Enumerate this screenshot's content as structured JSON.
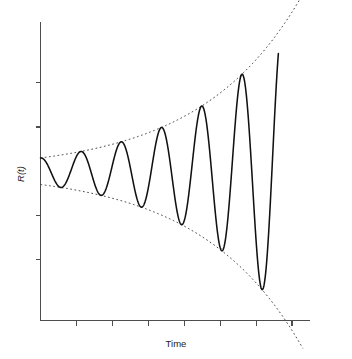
{
  "chart_data": {
    "type": "line",
    "title": "",
    "subtitle": "",
    "xlabel": "Time",
    "ylabel": "R(t)",
    "grid": false,
    "legend": null,
    "legend_position": "none",
    "axis_ticks_labeled": false,
    "xlim": [
      0,
      7.5
    ],
    "ylim": [
      -1.35,
      1.35
    ],
    "x_tick_count": 7,
    "x_ticks": [
      1,
      2,
      3,
      4,
      5,
      6,
      7
    ],
    "y_tick_count": 4,
    "y_ticks": [
      -0.8,
      -0.4,
      0.4,
      0.8
    ],
    "series": [
      {
        "name": "R(t)",
        "style": "solid",
        "color": "#111111",
        "model": "growing-cosine",
        "formula": "R(t) = A0 * exp(g*t) * cos(2*pi*t/T)",
        "A0": 0.12,
        "growth_rate": 0.355,
        "period": 1.12,
        "phase": 0.0,
        "t_start": 0.0,
        "t_end": 6.62,
        "samples": 900,
        "peaks": [
          {
            "t": 0.0,
            "value": 0.12
          },
          {
            "t": 1.12,
            "value": 0.179
          },
          {
            "t": 2.24,
            "value": 0.266
          },
          {
            "t": 3.36,
            "value": 0.396
          },
          {
            "t": 4.48,
            "value": 0.59
          },
          {
            "t": 5.6,
            "value": 0.879
          }
        ],
        "troughs": [
          {
            "t": 0.56,
            "value": -0.146
          },
          {
            "t": 1.68,
            "value": -0.218
          },
          {
            "t": 2.8,
            "value": -0.325
          },
          {
            "t": 3.92,
            "value": -0.484
          },
          {
            "t": 5.04,
            "value": -0.72
          },
          {
            "t": 6.16,
            "value": -1.072
          }
        ]
      },
      {
        "name": "upper envelope",
        "style": "dashed",
        "color": "#3a3a3a",
        "model": "exponential-envelope-upper",
        "formula": "+A0 * exp(g*t)",
        "endpoints": [
          {
            "t": 0.0,
            "value": 0.12
          },
          {
            "t": 7.3,
            "value": 1.28
          }
        ]
      },
      {
        "name": "lower envelope",
        "style": "dashed",
        "color": "#3a3a3a",
        "model": "exponential-envelope-lower",
        "formula": "-A0 * exp(g*t)",
        "endpoints": [
          {
            "t": 0.0,
            "value": -0.12
          },
          {
            "t": 7.3,
            "value": -1.28
          }
        ]
      }
    ]
  },
  "figure": {
    "background_color": "#ffffff",
    "axis_color": "#4d4d4d",
    "curve_color": "#111111",
    "envelope_color": "#3a3a3a"
  }
}
